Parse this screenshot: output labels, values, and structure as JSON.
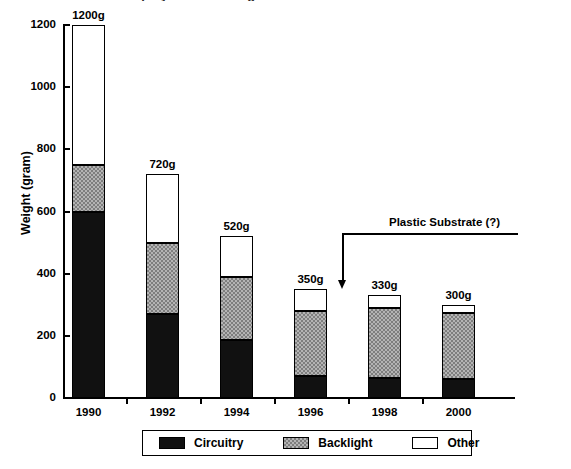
{
  "figure": {
    "clipped_title": "Display Module Weight Trend",
    "annotation": {
      "text": "Plastic Substrate (?)",
      "points_to_category": "1996"
    }
  },
  "legend": {
    "position": "bottom",
    "entries": [
      {
        "label": "Circuitry",
        "swatch": "black-solid",
        "color": "#111111"
      },
      {
        "label": "Backlight",
        "swatch": "gray-dither",
        "color": "#b4b4b4"
      },
      {
        "label": "Other",
        "swatch": "white-outline",
        "color": "#ffffff"
      }
    ]
  },
  "chart_data": {
    "type": "bar",
    "title": "",
    "xlabel": "",
    "ylabel": "Weight (gram)",
    "ylim": [
      0,
      1200
    ],
    "yticks": [
      0,
      200,
      400,
      600,
      800,
      1000,
      1200
    ],
    "ytick_labels": [
      "0",
      "200",
      "400",
      "600",
      "800",
      "1000",
      "1200"
    ],
    "grid": false,
    "stacked": true,
    "categories": [
      "1990",
      "1992",
      "1994",
      "1996",
      "1998",
      "2000"
    ],
    "series": [
      {
        "name": "Circuitry",
        "values": [
          600,
          270,
          185,
          70,
          65,
          60
        ]
      },
      {
        "name": "Backlight",
        "values": [
          150,
          230,
          205,
          210,
          225,
          215
        ]
      },
      {
        "name": "Other",
        "values": [
          450,
          220,
          130,
          70,
          40,
          25
        ]
      }
    ],
    "totals": [
      1200,
      720,
      520,
      350,
      330,
      300
    ],
    "total_labels": [
      "1200g",
      "720g",
      "520g",
      "350g",
      "330g",
      "300g"
    ]
  }
}
